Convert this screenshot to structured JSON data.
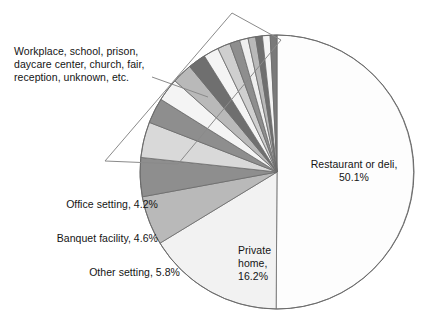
{
  "chart_data": {
    "type": "pie",
    "title": "",
    "subtitle": "",
    "xlabel": "",
    "ylabel": "",
    "legend_position": "callout-labels",
    "grid": false,
    "start_angle_deg": 0,
    "direction": "clockwise",
    "center": {
      "x": 277,
      "y": 172
    },
    "radius": 137,
    "categories": [
      "Restaurant or deli",
      "Private home",
      "Other setting",
      "Banquet facility",
      "Office setting",
      "Workplace, school, prison, daycare center, church, fair, reception, unknown, etc."
    ],
    "values": [
      50.1,
      16.2,
      5.8,
      4.6,
      4.2,
      19.1
    ],
    "value_suffix": "%",
    "slices": [
      {
        "name": "Restaurant or deli",
        "value": 50.1,
        "color": "#fdfdfd"
      },
      {
        "name": "Private home",
        "value": 16.2,
        "color": "#f2f2f2"
      },
      {
        "name": "Other setting",
        "value": 5.8,
        "color": "#b9b9b9"
      },
      {
        "name": "Banquet facility",
        "value": 4.6,
        "color": "#8e8e8e"
      },
      {
        "name": "Office setting",
        "value": 4.2,
        "color": "#d9d9d9"
      },
      {
        "name": "grouped-slice-1",
        "value": 3.0,
        "color": "#8e8e8e"
      },
      {
        "name": "grouped-slice-2",
        "value": 2.7,
        "color": "#f4f4f4"
      },
      {
        "name": "grouped-slice-3",
        "value": 2.4,
        "color": "#b9b9b9"
      },
      {
        "name": "grouped-slice-4",
        "value": 2.1,
        "color": "#6f6f6f"
      },
      {
        "name": "grouped-slice-5",
        "value": 1.8,
        "color": "#f4f4f4"
      },
      {
        "name": "grouped-slice-6",
        "value": 1.5,
        "color": "#cfcfcf"
      },
      {
        "name": "grouped-slice-7",
        "value": 1.2,
        "color": "#8e8e8e"
      },
      {
        "name": "grouped-slice-8",
        "value": 1.0,
        "color": "#efefef"
      },
      {
        "name": "grouped-slice-9",
        "value": 0.9,
        "color": "#b9b9b9"
      },
      {
        "name": "grouped-slice-10",
        "value": 0.8,
        "color": "#6f6f6f"
      },
      {
        "name": "grouped-slice-11",
        "value": 0.9,
        "color": "#f4f4f4"
      },
      {
        "name": "grouped-slice-12",
        "value": 0.8,
        "color": "#7a7a7a"
      }
    ],
    "annotations": [
      {
        "id": "group-callout",
        "text": "Workplace, school, prison,\ndaycare center, church, fair,\nreception, unknown, etc.",
        "covers": "grouped thin slices"
      }
    ]
  },
  "labels": {
    "group_note": "Workplace, school, prison,\ndaycare center, church, fair,\nreception, unknown, etc.",
    "restaurant": "Restaurant or deli,\n50.1%",
    "private_home": "Private\nhome,\n16.2%",
    "office": "Office setting, 4.2%",
    "banquet": "Banquet facility, 4.6%",
    "other": "Other setting, 5.8%"
  },
  "colors": {
    "outline": "#6b6b6b",
    "callout_outline": "#8a8a8a",
    "leader_line": "#8a8a8a",
    "text": "#141414",
    "background": "#ffffff"
  }
}
